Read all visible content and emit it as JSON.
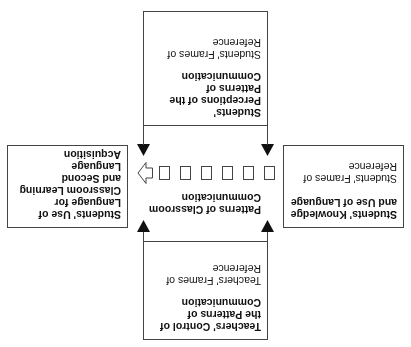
{
  "diagram": {
    "top_box": {
      "title_lines": [
        "Teachers' Control of",
        "the Patterns of",
        "Communication"
      ],
      "subtitle_lines": [
        "Teachers' Frames of",
        "Reference"
      ]
    },
    "center": {
      "title_lines": [
        "Patterns of Classroom",
        "Communication"
      ],
      "square_count": 6
    },
    "left_box": {
      "title_lines": [
        "Students' Knowledge",
        "and Use of Language"
      ],
      "subtitle_lines": [
        "Students' Frames of",
        "Reference"
      ]
    },
    "right_box": {
      "title_lines": [
        "Students' Use of",
        "Language for",
        "Classroom Learning",
        "and Second",
        "Language Acquisition"
      ]
    },
    "bottom_box": {
      "title_lines": [
        "Students'",
        "Perceptions of the",
        "Patterns of",
        "Communication"
      ],
      "subtitle_lines": [
        "Students' Frames of",
        "Reference"
      ]
    },
    "orientation": "rotated 180 degrees",
    "colors": {
      "stroke": "#444444",
      "text": "#111111",
      "background": "#ffffff"
    }
  }
}
